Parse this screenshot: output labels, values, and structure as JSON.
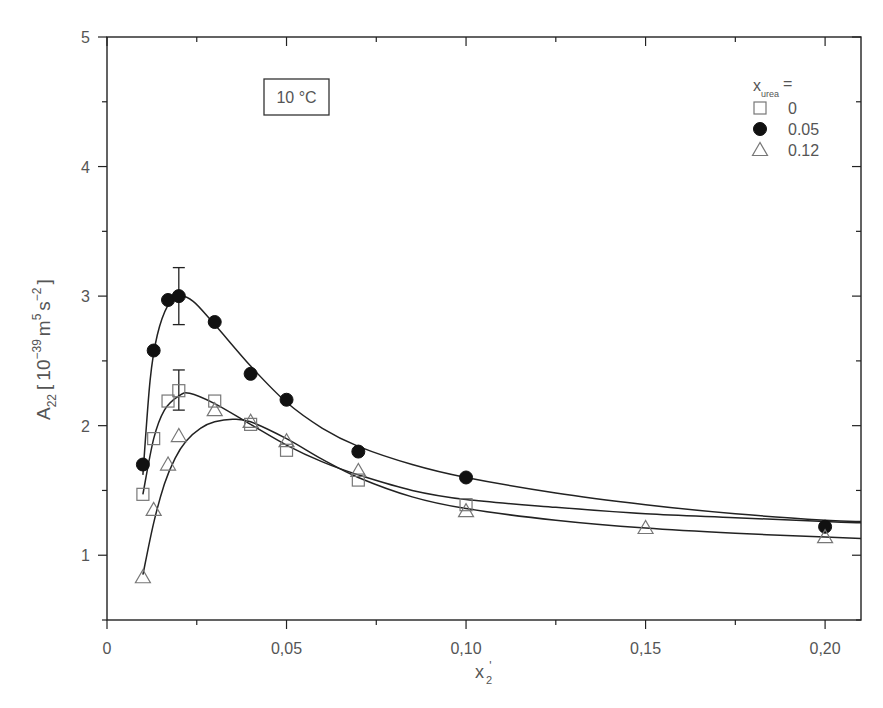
{
  "chart_data": {
    "type": "scatter",
    "title": "",
    "annotation": "10 °C",
    "xlabel": "x2'",
    "xlabel_parts": {
      "base": "x",
      "sub": "2",
      "sup": "'"
    },
    "ylabel": "A22 [10^-39 m^5 s^-2]",
    "ylabel_parts": {
      "base": "A",
      "sub": "22",
      "bracket_open": "[",
      "num": "10",
      "exp1": "−39",
      "unit1": "m",
      "exp2": "5",
      "unit2": "s",
      "exp3": "−2",
      "bracket_close": "]"
    },
    "xlim": [
      0,
      0.21
    ],
    "ylim": [
      0.5,
      5
    ],
    "x_ticks": [
      0,
      0.05,
      0.1,
      0.15,
      0.2
    ],
    "x_tick_labels": [
      "0",
      "0,05",
      "0,10",
      "0,15",
      "0,20"
    ],
    "y_ticks": [
      1,
      2,
      3,
      4,
      5
    ],
    "y_tick_labels": [
      "1",
      "2",
      "3",
      "4",
      "5"
    ],
    "grid": false,
    "legend": {
      "title": "x_urea =",
      "title_parts": {
        "base": "x",
        "sub": "urea",
        "suffix": "="
      },
      "position": "upper right",
      "entries": [
        {
          "marker": "open-square",
          "label": "0"
        },
        {
          "marker": "filled-circle",
          "label": "0.05"
        },
        {
          "marker": "open-triangle",
          "label": "0.12"
        }
      ]
    },
    "series": [
      {
        "name": "0",
        "marker": "open-square",
        "x": [
          0.01,
          0.013,
          0.017,
          0.02,
          0.03,
          0.04,
          0.05,
          0.07,
          0.1
        ],
        "y": [
          1.47,
          1.9,
          2.19,
          2.27,
          2.19,
          2.01,
          1.81,
          1.58,
          1.39
        ],
        "error_bars": [
          {
            "x": 0.02,
            "low": 2.12,
            "high": 2.43
          }
        ],
        "fit_curve": [
          [
            0.01,
            1.47
          ],
          [
            0.013,
            1.9
          ],
          [
            0.016,
            2.12
          ],
          [
            0.02,
            2.23
          ],
          [
            0.023,
            2.25
          ],
          [
            0.03,
            2.17
          ],
          [
            0.04,
            2.01
          ],
          [
            0.05,
            1.85
          ],
          [
            0.06,
            1.72
          ],
          [
            0.07,
            1.62
          ],
          [
            0.085,
            1.5
          ],
          [
            0.1,
            1.43
          ],
          [
            0.125,
            1.37
          ],
          [
            0.15,
            1.32
          ],
          [
            0.175,
            1.29
          ],
          [
            0.2,
            1.26
          ],
          [
            0.21,
            1.25
          ]
        ]
      },
      {
        "name": "0.05",
        "marker": "filled-circle",
        "x": [
          0.01,
          0.013,
          0.017,
          0.02,
          0.03,
          0.04,
          0.05,
          0.07,
          0.1,
          0.2
        ],
        "y": [
          1.7,
          2.58,
          2.97,
          3.0,
          2.8,
          2.4,
          2.2,
          1.8,
          1.6,
          1.22
        ],
        "error_bars": [
          {
            "x": 0.02,
            "low": 2.78,
            "high": 3.22
          }
        ],
        "fit_curve": [
          [
            0.01,
            1.62
          ],
          [
            0.012,
            2.35
          ],
          [
            0.014,
            2.7
          ],
          [
            0.017,
            2.93
          ],
          [
            0.02,
            3.0
          ],
          [
            0.024,
            2.96
          ],
          [
            0.03,
            2.78
          ],
          [
            0.04,
            2.46
          ],
          [
            0.05,
            2.18
          ],
          [
            0.06,
            1.98
          ],
          [
            0.07,
            1.84
          ],
          [
            0.085,
            1.7
          ],
          [
            0.1,
            1.6
          ],
          [
            0.125,
            1.48
          ],
          [
            0.15,
            1.39
          ],
          [
            0.175,
            1.32
          ],
          [
            0.2,
            1.27
          ],
          [
            0.21,
            1.26
          ]
        ]
      },
      {
        "name": "0.12",
        "marker": "open-triangle",
        "x": [
          0.01,
          0.013,
          0.017,
          0.02,
          0.03,
          0.04,
          0.05,
          0.07,
          0.1,
          0.15,
          0.2
        ],
        "y": [
          0.83,
          1.35,
          1.7,
          1.92,
          2.12,
          2.03,
          1.88,
          1.65,
          1.34,
          1.21,
          1.14
        ],
        "error_bars": [],
        "fit_curve": [
          [
            0.01,
            0.85
          ],
          [
            0.013,
            1.25
          ],
          [
            0.016,
            1.55
          ],
          [
            0.019,
            1.75
          ],
          [
            0.022,
            1.88
          ],
          [
            0.026,
            1.98
          ],
          [
            0.03,
            2.03
          ],
          [
            0.035,
            2.05
          ],
          [
            0.04,
            2.03
          ],
          [
            0.05,
            1.9
          ],
          [
            0.06,
            1.74
          ],
          [
            0.07,
            1.6
          ],
          [
            0.085,
            1.45
          ],
          [
            0.1,
            1.36
          ],
          [
            0.125,
            1.27
          ],
          [
            0.15,
            1.21
          ],
          [
            0.175,
            1.17
          ],
          [
            0.2,
            1.14
          ],
          [
            0.21,
            1.13
          ]
        ]
      }
    ]
  },
  "layout": {
    "plot_left": 107,
    "plot_right": 861,
    "plot_top": 37,
    "plot_bottom": 620,
    "line_color": "#222222",
    "text_color": "#555555",
    "marker_stroke": "#777777",
    "marker_fill": "#111111"
  }
}
